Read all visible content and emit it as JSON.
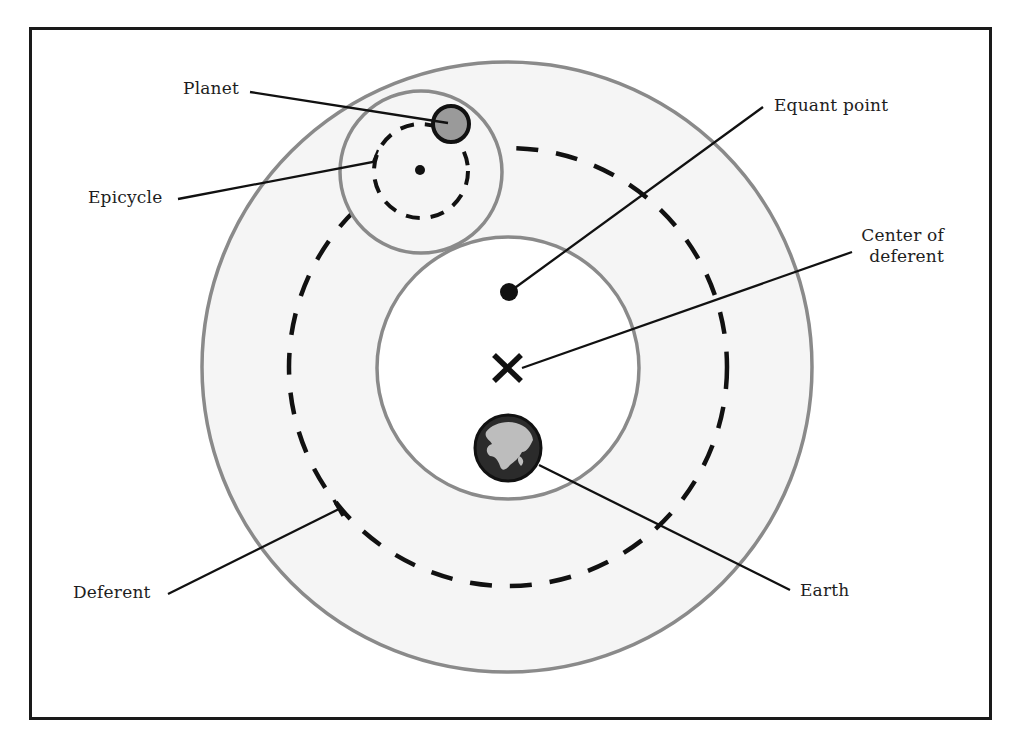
{
  "diagram": {
    "type": "ptolemaic-model",
    "colors": {
      "frame": "#1a1a1a",
      "outer_fill": "#f5f5f5",
      "circle_stroke": "#8a8a8a",
      "inner_fill": "#ffffff",
      "dash": "#111111",
      "planet_fill": "#9a9a9a",
      "earth_dark": "#2b2b2b",
      "earth_land": "#bdbdbd",
      "leader": "#111111"
    },
    "labels": {
      "planet": "Planet",
      "epicycle": "Epicycle",
      "deferent": "Deferent",
      "equant_point": "Equant point",
      "center_line1": "Center of",
      "center_line2": "deferent",
      "earth": "Earth"
    },
    "markers": {
      "center_symbol": "X"
    }
  }
}
